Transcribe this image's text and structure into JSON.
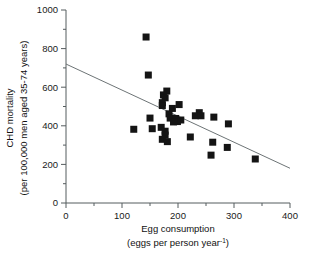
{
  "chart_data": {
    "type": "scatter",
    "title": "",
    "xlabel": "Egg consumption",
    "xlabel_line2": "(eggs per person year",
    "xlabel_exponent": "-1",
    "xlabel_line2_close": ")",
    "ylabel": "CHD mortality",
    "ylabel_line2": "(per 100,000 men aged 35-74 years)",
    "xlim": [
      0,
      400
    ],
    "ylim": [
      0,
      1000
    ],
    "xticks": [
      0,
      100,
      200,
      300,
      400
    ],
    "yticks": [
      0,
      200,
      400,
      600,
      800,
      1000
    ],
    "xtick_labels": [
      "0",
      "100",
      "200",
      "300",
      "400"
    ],
    "ytick_labels": [
      "0",
      "200",
      "400",
      "600",
      "800",
      "1000"
    ],
    "x_minor_tick_step": 50,
    "y_minor_tick_step": 100,
    "grid": false,
    "legend": false,
    "marker_style": "filled-square",
    "marker_color": "#141414",
    "marker_size_px": 7,
    "axis_color": "#555c5e",
    "trendline": {
      "label": "linear regression",
      "color": "#6d7476",
      "x": [
        0,
        400
      ],
      "y": [
        720,
        180
      ]
    },
    "points": [
      {
        "x": 143,
        "y": 860
      },
      {
        "x": 147,
        "y": 663
      },
      {
        "x": 180,
        "y": 580
      },
      {
        "x": 174,
        "y": 560
      },
      {
        "x": 177,
        "y": 545
      },
      {
        "x": 172,
        "y": 520
      },
      {
        "x": 172,
        "y": 505
      },
      {
        "x": 202,
        "y": 510
      },
      {
        "x": 190,
        "y": 490
      },
      {
        "x": 184,
        "y": 462
      },
      {
        "x": 238,
        "y": 468
      },
      {
        "x": 231,
        "y": 452
      },
      {
        "x": 241,
        "y": 452
      },
      {
        "x": 186,
        "y": 440
      },
      {
        "x": 196,
        "y": 438
      },
      {
        "x": 150,
        "y": 440
      },
      {
        "x": 205,
        "y": 430
      },
      {
        "x": 199,
        "y": 422
      },
      {
        "x": 192,
        "y": 420
      },
      {
        "x": 264,
        "y": 445
      },
      {
        "x": 290,
        "y": 410
      },
      {
        "x": 121,
        "y": 382
      },
      {
        "x": 154,
        "y": 385
      },
      {
        "x": 170,
        "y": 392
      },
      {
        "x": 177,
        "y": 372
      },
      {
        "x": 177,
        "y": 352
      },
      {
        "x": 222,
        "y": 342
      },
      {
        "x": 172,
        "y": 330
      },
      {
        "x": 181,
        "y": 318
      },
      {
        "x": 262,
        "y": 315
      },
      {
        "x": 288,
        "y": 288
      },
      {
        "x": 259,
        "y": 248
      },
      {
        "x": 338,
        "y": 228
      }
    ]
  }
}
